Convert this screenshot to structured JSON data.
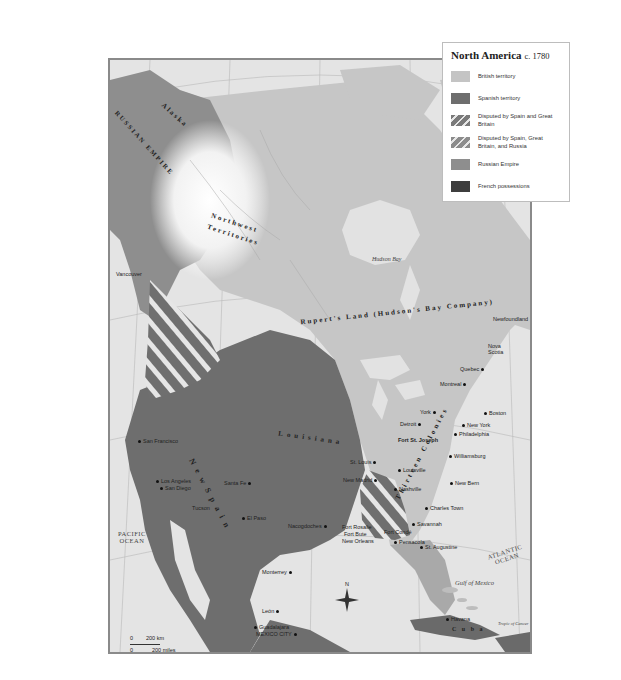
{
  "legend": {
    "title": "North America",
    "year": "c. 1780",
    "items": [
      {
        "label": "British territory",
        "color": "#c4c4c4",
        "pattern": "solid"
      },
      {
        "label": "Spanish territory",
        "color": "#6e6e6e",
        "pattern": "solid"
      },
      {
        "label": "Disputed by Spain and Great Britain",
        "color": "#7a7a7a",
        "pattern": "hatched"
      },
      {
        "label": "Disputed by Spain, Great Britain, and Russia",
        "color": "#8c8c8c",
        "pattern": "hatched"
      },
      {
        "label": "Russian Empire",
        "color": "#8e8e8e",
        "pattern": "solid"
      },
      {
        "label": "French possessions",
        "color": "#3e3e3e",
        "pattern": "solid"
      }
    ]
  },
  "regions": {
    "alaska": "Alaska",
    "russian_empire": "RUSSIAN EMPIRE",
    "northwest": "Northwest",
    "territories": "Territories",
    "ruperts_land": "Rupert's Land (Hudson's Bay Company)",
    "louisiana": "Louisiana",
    "new_spain": "N e w   S p a i n",
    "thirteen_colonies": "Thirteen Colonies",
    "nova_scotia": "Nova Scotia",
    "newfoundland": "Newfoundland",
    "cuba": "C u b a"
  },
  "water": {
    "hudson_bay": "Hudson Bay",
    "gulf_of_mexico": "Gulf of Mexico",
    "pacific": "PACIFIC\nOCEAN",
    "atlantic": "ATLANTIC\nOCEAN",
    "bahama": "Bahama Islands",
    "tropic": "Tropic of Cancer"
  },
  "cities": {
    "vancouver": "Vancouver",
    "quebec": "Quebec",
    "montreal": "Montreal",
    "york": "York",
    "detroit": "Detroit",
    "fort_st_joseph": "Fort St. Joseph",
    "boston": "Boston",
    "new_york": "New York",
    "philadelphia": "Philadelphia",
    "williamsburg": "Williamsburg",
    "new_bern": "New Bern",
    "charles_town": "Charles Town",
    "savannah": "Savannah",
    "st_augustine": "St. Augustine",
    "st_louis": "St. Louis",
    "louisville": "Louisville",
    "new_madrid": "New Madrid",
    "nashville": "Nashville",
    "fort_conde": "Fort Condé",
    "pensacola": "Pensacola",
    "fort_rosalie": "Fort Rosalie",
    "fort_baton_rouge": "Fort Bute",
    "new_orleans": "New Orleans",
    "natchitoches": "Nacogdoches",
    "san_francisco": "San Francisco",
    "los_angeles": "Los Angeles",
    "san_diego": "San Diego",
    "santa_fe": "Santa Fe",
    "tucson": "Tucson",
    "el_paso": "El Paso",
    "monterrey": "Monterrey",
    "leon": "León",
    "guadalajara": "Guadalajara",
    "mexico_city": "MEXICO CITY",
    "havana": "Havana"
  },
  "scale": {
    "km": "200 km",
    "miles": "200 miles",
    "zero": "0"
  },
  "compass": {
    "north": "N"
  }
}
